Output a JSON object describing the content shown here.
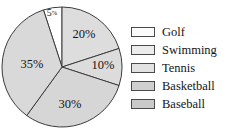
{
  "chart_data": {
    "type": "pie",
    "title": "",
    "categories": [
      "Golf",
      "Swimming",
      "Tennis",
      "Basketball",
      "Baseball"
    ],
    "values": [
      5,
      20,
      10,
      30,
      35
    ],
    "value_labels": [
      "5%",
      "20%",
      "10%",
      "30%",
      "35%"
    ],
    "units": "percent",
    "total": 100,
    "legend_position": "right",
    "grid": false,
    "start_angle_deg": -18,
    "direction": "clockwise",
    "slice_colors": [
      "#ffffff",
      "#dddddd",
      "#dcdcdc",
      "#d6d6d6",
      "#d9d9d9"
    ],
    "slice_outline_color": "#3c3c3c",
    "label_color": "#141414",
    "background_color": "#ffffff",
    "slices": [
      {
        "name": "Golf",
        "value": 5,
        "label": "5%",
        "swatch_color": "#fbfbfb",
        "fill": "#ffffff",
        "label_x": 52,
        "label_y": 14,
        "label_size": "small"
      },
      {
        "name": "Swimming",
        "value": 20,
        "label": "20%",
        "swatch_color": "#ececec",
        "fill": "#dddddd",
        "label_x": 84,
        "label_y": 35,
        "label_size": "normal"
      },
      {
        "name": "Tennis",
        "value": 10,
        "label": "10%",
        "swatch_color": "#e2e2e2",
        "fill": "#dcdcdc",
        "label_x": 103,
        "label_y": 66,
        "label_size": "normal"
      },
      {
        "name": "Basketball",
        "value": 30,
        "label": "30%",
        "swatch_color": "#cfcfcf",
        "fill": "#d6d6d6",
        "label_x": 70,
        "label_y": 105,
        "label_size": "normal"
      },
      {
        "name": "Baseball",
        "value": 35,
        "label": "35%",
        "swatch_color": "#c9c9c9",
        "fill": "#d9d9d9",
        "label_x": 32,
        "label_y": 65,
        "label_size": "normal"
      }
    ],
    "legend": [
      {
        "label": "Golf",
        "color": "#fbfbfb"
      },
      {
        "label": "Swimming",
        "color": "#ececec"
      },
      {
        "label": "Tennis",
        "color": "#e2e2e2"
      },
      {
        "label": "Basketball",
        "color": "#cfcfcf"
      },
      {
        "label": "Baseball",
        "color": "#c9c9c9"
      }
    ]
  },
  "geometry": {
    "center_x": 62,
    "center_y": 67,
    "radius": 60
  }
}
